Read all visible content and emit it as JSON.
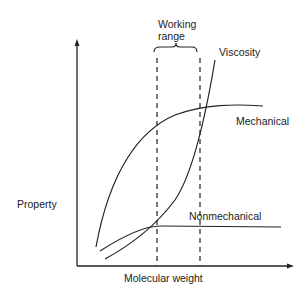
{
  "diagram": {
    "x_axis_label": "Molecular weight",
    "y_axis_label": "Property",
    "range_label_line1": "Working",
    "range_label_line2": "range",
    "curves": [
      {
        "name": "Viscosity",
        "label": "Viscosity"
      },
      {
        "name": "Mechanical",
        "label": "Mechanical"
      },
      {
        "name": "Nonmechanical",
        "label": "Nonmechanical"
      }
    ],
    "line_color": "#222222"
  }
}
